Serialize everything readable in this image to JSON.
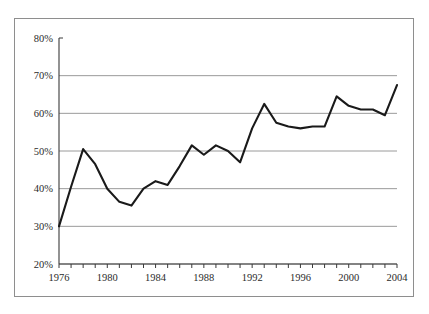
{
  "figure": {
    "background_color": "#ffffff",
    "frame_color": "#8e8e8e",
    "gridline_color": "#9a9a9a",
    "axis_color": "#3a3a3a",
    "line_color": "#1a1a1a",
    "text_color": "#2b2b2b"
  },
  "chart_data": {
    "type": "line",
    "title": "",
    "subtitle": "",
    "xlabel": "",
    "ylabel": "",
    "grid": true,
    "legend": false,
    "legend_position": "none",
    "xlim": [
      1976,
      2004
    ],
    "ylim": [
      20,
      80
    ],
    "y_tick_values": [
      20,
      30,
      40,
      50,
      60,
      70,
      80
    ],
    "y_tick_labels": [
      "20%",
      "30%",
      "40%",
      "50%",
      "60%",
      "70%",
      "80%"
    ],
    "x_tick_values": [
      1976,
      1977,
      1978,
      1979,
      1980,
      1981,
      1982,
      1983,
      1984,
      1985,
      1986,
      1987,
      1988,
      1989,
      1990,
      1991,
      1992,
      1993,
      1994,
      1995,
      1996,
      1997,
      1998,
      1999,
      2000,
      2001,
      2002,
      2003,
      2004
    ],
    "x_tick_labels": [
      "1976",
      "",
      "",
      "",
      "1980",
      "",
      "",
      "",
      "1984",
      "",
      "",
      "",
      "1988",
      "",
      "",
      "",
      "1992",
      "",
      "",
      "",
      "1996",
      "",
      "",
      "",
      "2000",
      "",
      "",
      "",
      "2004"
    ],
    "x_major_labels": [
      "1976",
      "1980",
      "1984",
      "1988",
      "1992",
      "1996",
      "2000",
      "2004"
    ],
    "x": [
      1976,
      1977,
      1978,
      1979,
      1980,
      1981,
      1982,
      1983,
      1984,
      1985,
      1986,
      1987,
      1988,
      1989,
      1990,
      1991,
      1992,
      1993,
      1994,
      1995,
      1996,
      1997,
      1998,
      1999,
      2000,
      2001,
      2002,
      2003,
      2004
    ],
    "values": [
      30.0,
      40.5,
      50.5,
      46.5,
      40.0,
      36.5,
      35.5,
      40.0,
      42.0,
      41.0,
      46.0,
      51.5,
      49.0,
      51.5,
      50.0,
      47.0,
      56.0,
      62.5,
      57.5,
      56.5,
      56.0,
      56.5,
      56.5,
      64.5,
      62.0,
      61.0,
      61.0,
      59.5,
      67.5
    ],
    "series": [
      {
        "name": "series-1",
        "values": [
          30.0,
          40.5,
          50.5,
          46.5,
          40.0,
          36.5,
          35.5,
          40.0,
          42.0,
          41.0,
          46.0,
          51.5,
          49.0,
          51.5,
          50.0,
          47.0,
          56.0,
          62.5,
          57.5,
          56.5,
          56.0,
          56.5,
          56.5,
          64.5,
          62.0,
          61.0,
          61.0,
          59.5,
          67.5
        ]
      }
    ]
  }
}
